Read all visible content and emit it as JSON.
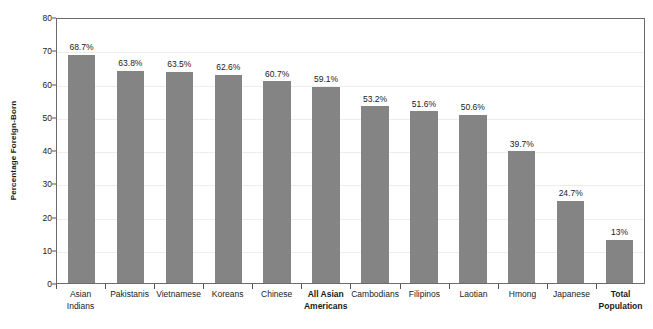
{
  "chart_data": {
    "type": "bar",
    "title": "",
    "subtitle": "",
    "xlabel": "",
    "ylabel": "Percentage Foreign-Born",
    "ylim": [
      0,
      80
    ],
    "yticks": [
      0,
      10,
      20,
      30,
      40,
      50,
      60,
      70,
      80
    ],
    "ytick_labels": [
      "0",
      "10",
      "20",
      "30",
      "40",
      "50",
      "60",
      "70",
      "80"
    ],
    "grid": "horizontal",
    "legend": "none",
    "bar_color": "#848484",
    "categories": [
      "Asian Indians",
      "Pakistanis",
      "Vietnamese",
      "Koreans",
      "Chinese",
      "All Asian Americans",
      "Cambodians",
      "Filipinos",
      "Laotian",
      "Hmong",
      "Japanese",
      "Total Population"
    ],
    "category_lines": [
      [
        "Asian",
        "Indians"
      ],
      [
        "Pakistanis"
      ],
      [
        "Vietnamese"
      ],
      [
        "Koreans"
      ],
      [
        "Chinese"
      ],
      [
        "All Asian",
        "Americans"
      ],
      [
        "Cambodians"
      ],
      [
        "Filipinos"
      ],
      [
        "Laotian"
      ],
      [
        "Hmong"
      ],
      [
        "Japanese"
      ],
      [
        "Total",
        "Population"
      ]
    ],
    "emphasized_categories": [
      "All Asian Americans",
      "Total Population"
    ],
    "values": [
      68.7,
      63.8,
      63.5,
      62.6,
      60.7,
      59.1,
      53.2,
      51.6,
      50.6,
      39.7,
      24.7,
      13
    ],
    "value_labels": [
      "68.7%",
      "63.8%",
      "63.5%",
      "62.6%",
      "60.7%",
      "59.1%",
      "53.2%",
      "51.6%",
      "50.6%",
      "39.7%",
      "24.7%",
      "13%"
    ]
  }
}
